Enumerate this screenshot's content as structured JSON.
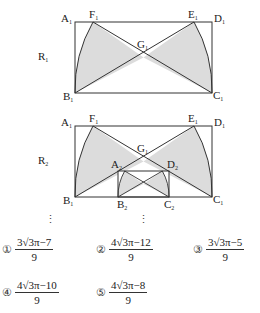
{
  "corner_mark": "[3점]",
  "figure1": {
    "label": "R",
    "label_sub": "1",
    "points": {
      "A1": {
        "name": "A",
        "sub": "1"
      },
      "F1": {
        "name": "F",
        "sub": "1"
      },
      "E1": {
        "name": "E",
        "sub": "1"
      },
      "D1": {
        "name": "D",
        "sub": "1"
      },
      "G1": {
        "name": "G",
        "sub": "1"
      },
      "B1": {
        "name": "B",
        "sub": "1"
      },
      "C1": {
        "name": "C",
        "sub": "1"
      }
    }
  },
  "figure2": {
    "label": "R",
    "label_sub": "2",
    "points": {
      "A1": {
        "name": "A",
        "sub": "1"
      },
      "F1": {
        "name": "F",
        "sub": "1"
      },
      "E1": {
        "name": "E",
        "sub": "1"
      },
      "D1": {
        "name": "D",
        "sub": "1"
      },
      "G1": {
        "name": "G",
        "sub": "1"
      },
      "A2": {
        "name": "A",
        "sub": "2"
      },
      "D2": {
        "name": "D",
        "sub": "2"
      },
      "B1": {
        "name": "B",
        "sub": "1"
      },
      "B2": {
        "name": "B",
        "sub": "2"
      },
      "C2": {
        "name": "C",
        "sub": "2"
      },
      "C1": {
        "name": "C",
        "sub": "1"
      }
    }
  },
  "ellipsis": "⋮",
  "options": [
    {
      "marker": "①",
      "numerator": "3√3π−7",
      "denominator": "9"
    },
    {
      "marker": "②",
      "numerator": "4√3π−12",
      "denominator": "9"
    },
    {
      "marker": "③",
      "numerator": "3√3π−5",
      "denominator": "9"
    },
    {
      "marker": "④",
      "numerator": "4√3π−10",
      "denominator": "9"
    },
    {
      "marker": "⑤",
      "numerator": "4√3π−8",
      "denominator": "9"
    }
  ],
  "colors": {
    "shade": "#dcdcdc",
    "stroke": "#333333"
  }
}
